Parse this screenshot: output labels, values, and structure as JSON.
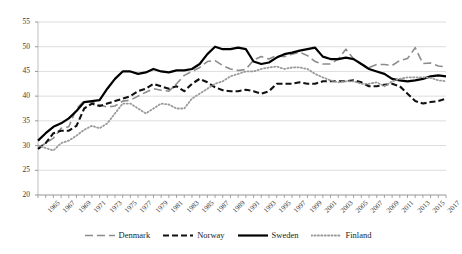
{
  "chart_data": {
    "type": "line",
    "title": "",
    "subtitle": "",
    "xlabel": "",
    "ylabel": "",
    "xlim": [
      1965,
      2018
    ],
    "ylim": [
      20,
      55
    ],
    "yticks": [
      20,
      25,
      30,
      35,
      40,
      45,
      50,
      55
    ],
    "grid": true,
    "legend_position": "bottom",
    "x": [
      1965,
      1966,
      1967,
      1968,
      1969,
      1970,
      1971,
      1972,
      1973,
      1974,
      1975,
      1976,
      1977,
      1978,
      1979,
      1980,
      1981,
      1982,
      1983,
      1984,
      1985,
      1986,
      1987,
      1988,
      1989,
      1990,
      1991,
      1992,
      1993,
      1994,
      1995,
      1996,
      1997,
      1998,
      1999,
      2000,
      2001,
      2002,
      2003,
      2004,
      2005,
      2006,
      2007,
      2008,
      2009,
      2010,
      2011,
      2012,
      2013,
      2014,
      2015,
      2016,
      2017,
      2018
    ],
    "xtick_labels": [
      "1965",
      "1967",
      "1969",
      "1971",
      "1973",
      "1975",
      "1977",
      "1979",
      "1981",
      "1983",
      "1985",
      "1987",
      "1989",
      "1991",
      "1993",
      "1995",
      "1997",
      "1999",
      "2001",
      "2003",
      "2005",
      "2007",
      "2009",
      "2011",
      "2013",
      "2015",
      "2017"
    ],
    "series": [
      {
        "name": "Denmark",
        "color": "#8c8c8c",
        "style": "dashed-long",
        "width": 1.6,
        "values": [
          29.5,
          30.5,
          31.5,
          33.5,
          33.8,
          37.5,
          39.0,
          38.8,
          38.2,
          37.8,
          38.0,
          39.0,
          39.2,
          40.0,
          40.8,
          41.5,
          41.2,
          41.0,
          42.5,
          44.2,
          45.0,
          45.8,
          47.0,
          47.2,
          46.2,
          45.5,
          45.2,
          45.4,
          47.3,
          48.0,
          47.5,
          48.2,
          48.0,
          48.5,
          48.9,
          48.2,
          47.0,
          46.5,
          46.5,
          47.5,
          49.5,
          47.5,
          46.5,
          45.8,
          46.4,
          46.4,
          46.2,
          47.2,
          47.6,
          49.8,
          46.6,
          46.7,
          46.1,
          45.9
        ]
      },
      {
        "name": "Norway",
        "color": "#111111",
        "style": "dashed",
        "width": 2.1,
        "values": [
          29.3,
          30.5,
          32.5,
          33.0,
          33.0,
          34.0,
          37.5,
          38.5,
          38.0,
          38.5,
          39.0,
          39.5,
          40.0,
          41.0,
          41.5,
          42.5,
          42.0,
          41.5,
          42.0,
          41.0,
          42.5,
          43.5,
          42.8,
          41.8,
          41.2,
          41.0,
          41.0,
          41.3,
          41.0,
          40.5,
          41.0,
          42.5,
          42.5,
          42.5,
          42.8,
          42.5,
          42.5,
          43.0,
          43.0,
          43.0,
          43.0,
          43.2,
          42.8,
          42.0,
          42.0,
          42.3,
          42.5,
          42.0,
          40.5,
          39.0,
          38.5,
          38.8,
          39.0,
          39.5
        ]
      },
      {
        "name": "Sweden",
        "color": "#000000",
        "style": "solid",
        "width": 2.2,
        "values": [
          31.0,
          32.5,
          33.8,
          34.5,
          35.5,
          37.0,
          38.8,
          39.0,
          39.2,
          41.5,
          43.5,
          45.0,
          45.0,
          44.5,
          44.8,
          45.5,
          45.0,
          44.8,
          45.2,
          45.2,
          45.5,
          46.5,
          48.5,
          50.0,
          49.5,
          49.5,
          49.8,
          49.5,
          47.0,
          46.5,
          46.8,
          47.8,
          48.5,
          48.8,
          49.2,
          49.5,
          49.8,
          48.0,
          47.5,
          47.5,
          47.8,
          47.5,
          46.5,
          45.5,
          45.0,
          44.5,
          43.5,
          43.2,
          43.0,
          43.2,
          43.5,
          44.0,
          44.2,
          44.0
        ]
      },
      {
        "name": "Finland",
        "color": "#9a9a9a",
        "style": "dotted",
        "width": 1.8,
        "values": [
          30.0,
          29.5,
          29.0,
          30.5,
          31.0,
          32.0,
          33.2,
          34.0,
          33.5,
          34.5,
          36.5,
          38.5,
          38.5,
          37.5,
          36.5,
          37.5,
          38.5,
          38.3,
          37.5,
          37.5,
          39.5,
          40.5,
          41.5,
          42.5,
          43.0,
          44.0,
          44.5,
          45.0,
          45.0,
          45.5,
          45.8,
          46.0,
          45.5,
          45.8,
          45.8,
          45.5,
          44.5,
          43.8,
          43.2,
          42.8,
          43.0,
          43.0,
          42.5,
          42.5,
          42.8,
          42.0,
          43.0,
          43.5,
          43.8,
          43.8,
          43.8,
          43.7,
          43.2,
          43.0
        ]
      }
    ]
  },
  "legend": {
    "items": [
      {
        "label": "Denmark"
      },
      {
        "label": "Norway"
      },
      {
        "label": "Sweden"
      },
      {
        "label": "Finland"
      }
    ]
  }
}
